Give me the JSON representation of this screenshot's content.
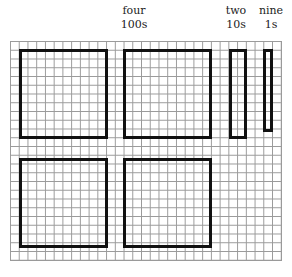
{
  "labels": {
    "hundreds": {
      "word": "four",
      "place": "100s"
    },
    "tens": {
      "word": "two",
      "place": "10s"
    },
    "ones": {
      "word": "nine",
      "place": "1s"
    }
  },
  "number_represented": 429,
  "grid": {
    "columns": 31,
    "rows": 25
  },
  "blocks": {
    "hundreds_count": 4,
    "tens_count": 2,
    "ones_count": 9
  }
}
